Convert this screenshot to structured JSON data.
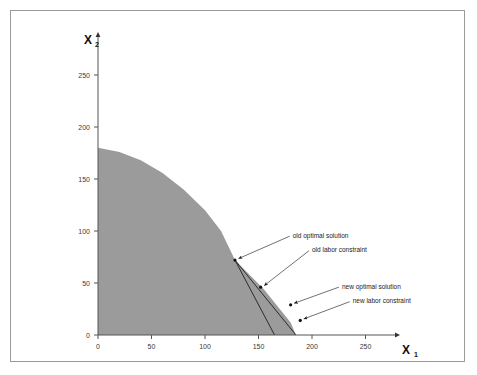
{
  "chart_data": {
    "type": "area",
    "title": "",
    "subtitle": "",
    "xlabel": "X",
    "xlabel_sub": "1",
    "ylabel": "X",
    "ylabel_sub": "2",
    "xlim": [
      0,
      285
    ],
    "ylim": [
      0,
      285
    ],
    "grid": false,
    "legend_position": "none",
    "x_ticks": [
      {
        "value": 0,
        "label": "0"
      },
      {
        "value": 50,
        "label": "50"
      },
      {
        "value": 100,
        "label": "100"
      },
      {
        "value": 150,
        "label": "150"
      },
      {
        "value": 200,
        "label": "200"
      },
      {
        "value": 250,
        "label": "250"
      }
    ],
    "y_ticks": [
      {
        "value": 0,
        "label": "0"
      },
      {
        "value": 50,
        "label": "50"
      },
      {
        "value": 100,
        "label": "100"
      },
      {
        "value": 150,
        "label": "150"
      },
      {
        "value": 200,
        "label": "200"
      },
      {
        "value": 250,
        "label": "250"
      }
    ],
    "feasible_region": {
      "name": "feasible region",
      "fill_color": "#9b9b9b",
      "boundary_points": [
        {
          "x": 0,
          "y": 0
        },
        {
          "x": 0,
          "y": 180
        },
        {
          "x": 20,
          "y": 176
        },
        {
          "x": 40,
          "y": 168
        },
        {
          "x": 60,
          "y": 156
        },
        {
          "x": 80,
          "y": 140
        },
        {
          "x": 100,
          "y": 120
        },
        {
          "x": 115,
          "y": 100
        },
        {
          "x": 128,
          "y": 72
        },
        {
          "x": 155,
          "y": 44
        },
        {
          "x": 180,
          "y": 12
        },
        {
          "x": 185,
          "y": 0
        }
      ]
    },
    "series": [
      {
        "name": "old labor constraint",
        "type": "line",
        "points": [
          {
            "x": 128,
            "y": 72
          },
          {
            "x": 165,
            "y": 0
          }
        ]
      },
      {
        "name": "new labor constraint",
        "type": "line",
        "points": [
          {
            "x": 128,
            "y": 72
          },
          {
            "x": 185,
            "y": 0
          }
        ]
      }
    ],
    "annotations": [
      {
        "id": "old-optimal-solution",
        "label": "old optimal solution",
        "point": {
          "x": 128,
          "y": 72
        },
        "label_position": {
          "x": 182,
          "y": 96
        }
      },
      {
        "id": "old-labor-constraint",
        "label": "old labor constraint",
        "point": {
          "x": 152,
          "y": 46
        },
        "label_position": {
          "x": 200,
          "y": 82
        }
      },
      {
        "id": "new-optimal-solution",
        "label": "new optimal solution",
        "point": {
          "x": 180,
          "y": 29
        },
        "label_position": {
          "x": 228,
          "y": 47
        }
      },
      {
        "id": "new-labor-constraint",
        "label": "new labor constraint",
        "point": {
          "x": 189,
          "y": 14
        },
        "label_position": {
          "x": 238,
          "y": 33
        }
      }
    ]
  }
}
